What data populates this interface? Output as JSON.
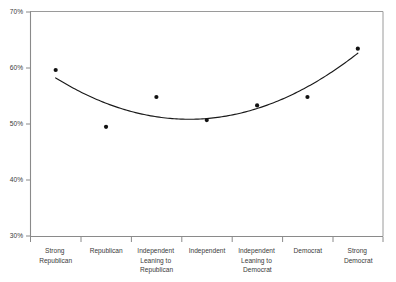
{
  "chart_data": {
    "type": "scatter",
    "title": "",
    "subtitle": "",
    "xlabel": "",
    "ylabel": "",
    "categories": [
      "Strong Republican",
      "Republican",
      "Independent Leaning to Republican",
      "Independent",
      "Independent Leaning to Democrat",
      "Democrat",
      "Strong Democrat"
    ],
    "category_lines": [
      [
        "Strong",
        "Republican"
      ],
      [
        "Republican"
      ],
      [
        "Independent",
        "Leaning to",
        "Republican"
      ],
      [
        "Independent"
      ],
      [
        "Independent",
        "Leaning to",
        "Democrat"
      ],
      [
        "Democrat"
      ],
      [
        "Strong",
        "Democrat"
      ]
    ],
    "values": [
      59.6,
      49.5,
      54.8,
      50.7,
      53.3,
      54.8,
      63.4
    ],
    "series": [
      {
        "name": "Observed",
        "values": [
          59.6,
          49.5,
          54.8,
          50.7,
          53.3,
          54.8,
          63.4
        ]
      },
      {
        "name": "Fitted quadratic curve",
        "values": [
          58.4,
          53.8,
          51.2,
          50.6,
          52.0,
          55.4,
          60.8
        ]
      }
    ],
    "ylim": [
      30,
      70
    ],
    "ytick_values": [
      30,
      40,
      50,
      60,
      70
    ],
    "ytick_labels": [
      "30%",
      "40%",
      "50%",
      "60%",
      "70%"
    ],
    "grid": false,
    "legend": false,
    "legend_position": "none",
    "marker": "filled-circle",
    "curve_style": "solid-thin-black",
    "annotations": []
  },
  "axis": {
    "y_min_label": "30%",
    "y_max_label": "70%",
    "tick_interval_label": "10%"
  },
  "colors": {
    "background": "#ffffff",
    "axis": "#8a8a8a",
    "frame": "#9a9a9a",
    "marker": "#111111",
    "curve": "#1a1a1a",
    "tick_text": "#3a3a3a"
  }
}
